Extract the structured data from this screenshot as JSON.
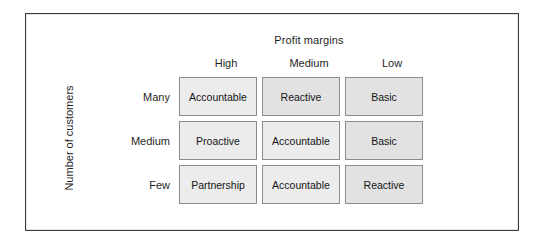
{
  "figure": {
    "title": "Profit margins",
    "y_axis_title": "Number of customers"
  },
  "colors": {
    "frame_border": "#3a3a3a",
    "cell_border": "#8c8c8c",
    "cell_fill_light": "#ececec",
    "cell_fill_dark": "#e2e2e2",
    "background": "#ffffff",
    "text": "#1f1f1f"
  },
  "chart_data": {
    "type": "table",
    "title": "Profit margins",
    "xlabel": "Profit margins",
    "ylabel": "Number of customers",
    "columns": [
      "High",
      "Medium",
      "Low"
    ],
    "rows": [
      "Many",
      "Medium",
      "Few"
    ],
    "cells": [
      [
        "Accountable",
        "Reactive",
        "Basic"
      ],
      [
        "Proactive",
        "Accountable",
        "Basic"
      ],
      [
        "Partnership",
        "Accountable",
        "Reactive"
      ]
    ],
    "cell_shades": [
      [
        "light",
        "dark",
        "dark"
      ],
      [
        "light",
        "light",
        "dark"
      ],
      [
        "light",
        "light",
        "dark"
      ]
    ]
  },
  "matrix": {
    "column_headers": [
      {
        "label": "High"
      },
      {
        "label": "Medium"
      },
      {
        "label": "Low"
      }
    ],
    "rows": [
      {
        "header": "Many",
        "cells": [
          {
            "label": "Accountable",
            "shade": "light"
          },
          {
            "label": "Reactive",
            "shade": "dark"
          },
          {
            "label": "Basic",
            "shade": "dark"
          }
        ]
      },
      {
        "header": "Medium",
        "cells": [
          {
            "label": "Proactive",
            "shade": "light"
          },
          {
            "label": "Accountable",
            "shade": "light"
          },
          {
            "label": "Basic",
            "shade": "dark"
          }
        ]
      },
      {
        "header": "Few",
        "cells": [
          {
            "label": "Partnership",
            "shade": "light"
          },
          {
            "label": "Accountable",
            "shade": "light"
          },
          {
            "label": "Reactive",
            "shade": "dark"
          }
        ]
      }
    ]
  }
}
